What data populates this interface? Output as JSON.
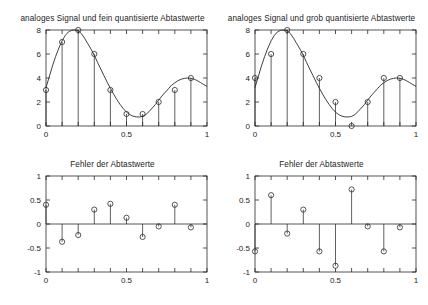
{
  "figure": {
    "background": "#ffffff",
    "line_color": "#2b2b2b",
    "axis_color": "#2a2a2a"
  },
  "panels": {
    "top_left": {
      "title": "analoges Signal und fein quantisierte Abtastwerte",
      "x_ticks": [
        "0",
        "0.5",
        "1"
      ],
      "y_ticks": [
        "0",
        "2",
        "4",
        "6",
        "8"
      ]
    },
    "top_right": {
      "title": "analoges Signal und grob quantisierte Abtastwerte",
      "x_ticks": [
        "0",
        "0.5",
        "1"
      ],
      "y_ticks": [
        "0",
        "2",
        "4",
        "6",
        "8"
      ]
    },
    "bottom_left": {
      "title": "Fehler der Abtastwerte",
      "x_ticks": [
        "0",
        "0.5",
        "1"
      ],
      "y_ticks": [
        "-1",
        "-0.5",
        "0",
        "0.5",
        "1"
      ]
    },
    "bottom_right": {
      "title": "Fehler der Abtastwerte",
      "x_ticks": [
        "0",
        "0.5",
        "1"
      ],
      "y_ticks": [
        "-1",
        "-0.5",
        "0",
        "0.5",
        "1"
      ]
    }
  },
  "chart_data": [
    {
      "id": "top_left",
      "type": "line",
      "title": "analoges Signal und fein quantisierte Abtastwerte",
      "xlabel": "",
      "ylabel": "",
      "xlim": [
        0,
        1
      ],
      "ylim": [
        0,
        8
      ],
      "xticks": [
        0,
        0.5,
        1
      ],
      "yticks": [
        0,
        2,
        4,
        6,
        8
      ],
      "minor_xticks": [
        0.1,
        0.2,
        0.3,
        0.4,
        0.6,
        0.7,
        0.8,
        0.9
      ],
      "grid": false,
      "legend": null,
      "series": [
        {
          "name": "analoges Signal",
          "type": "line",
          "x": [
            0.0,
            0.02,
            0.04,
            0.06,
            0.08,
            0.1,
            0.12,
            0.14,
            0.16,
            0.18,
            0.2,
            0.22,
            0.24,
            0.26,
            0.28,
            0.3,
            0.32,
            0.34,
            0.36,
            0.38,
            0.4,
            0.42,
            0.44,
            0.46,
            0.48,
            0.5,
            0.52,
            0.54,
            0.56,
            0.58,
            0.6,
            0.62,
            0.64,
            0.66,
            0.68,
            0.7,
            0.72,
            0.74,
            0.76,
            0.78,
            0.8,
            0.82,
            0.84,
            0.86,
            0.88,
            0.9,
            0.92,
            0.94,
            0.96,
            0.98,
            1.0
          ],
          "y": [
            3.2,
            4.1,
            5.0,
            5.8,
            6.5,
            7.1,
            7.55,
            7.85,
            7.98,
            8.0,
            7.95,
            7.7,
            7.3,
            6.85,
            6.4,
            5.9,
            5.3,
            4.75,
            4.2,
            3.65,
            3.15,
            2.65,
            2.2,
            1.8,
            1.45,
            1.15,
            0.95,
            0.82,
            0.76,
            0.75,
            0.8,
            0.95,
            1.2,
            1.5,
            1.8,
            2.15,
            2.5,
            2.8,
            3.1,
            3.4,
            3.6,
            3.78,
            3.9,
            3.97,
            4.0,
            3.98,
            3.9,
            3.78,
            3.62,
            3.45,
            3.3
          ]
        },
        {
          "name": "fein quantisierte Abtastwerte",
          "type": "stem",
          "x": [
            0.0,
            0.1,
            0.2,
            0.3,
            0.4,
            0.5,
            0.6,
            0.7,
            0.8,
            0.9
          ],
          "y": [
            3,
            7,
            8,
            6,
            3,
            1,
            1,
            2,
            3,
            4
          ]
        }
      ]
    },
    {
      "id": "top_right",
      "type": "line",
      "title": "analoges Signal und grob quantisierte Abtastwerte",
      "xlabel": "",
      "ylabel": "",
      "xlim": [
        0,
        1
      ],
      "ylim": [
        0,
        8
      ],
      "xticks": [
        0,
        0.5,
        1
      ],
      "yticks": [
        0,
        2,
        4,
        6,
        8
      ],
      "minor_xticks": [
        0.1,
        0.2,
        0.3,
        0.4,
        0.6,
        0.7,
        0.8,
        0.9
      ],
      "grid": false,
      "legend": null,
      "series": [
        {
          "name": "analoges Signal",
          "type": "line",
          "x": [
            0.0,
            0.02,
            0.04,
            0.06,
            0.08,
            0.1,
            0.12,
            0.14,
            0.16,
            0.18,
            0.2,
            0.22,
            0.24,
            0.26,
            0.28,
            0.3,
            0.32,
            0.34,
            0.36,
            0.38,
            0.4,
            0.42,
            0.44,
            0.46,
            0.48,
            0.5,
            0.52,
            0.54,
            0.56,
            0.58,
            0.6,
            0.62,
            0.64,
            0.66,
            0.68,
            0.7,
            0.72,
            0.74,
            0.76,
            0.78,
            0.8,
            0.82,
            0.84,
            0.86,
            0.88,
            0.9,
            0.92,
            0.94,
            0.96,
            0.98,
            1.0
          ],
          "y": [
            3.2,
            4.1,
            5.0,
            5.8,
            6.5,
            7.1,
            7.55,
            7.85,
            7.98,
            8.0,
            7.95,
            7.7,
            7.3,
            6.85,
            6.4,
            5.9,
            5.3,
            4.75,
            4.2,
            3.65,
            3.15,
            2.65,
            2.2,
            1.8,
            1.45,
            1.15,
            0.95,
            0.82,
            0.76,
            0.75,
            0.8,
            0.95,
            1.2,
            1.5,
            1.8,
            2.15,
            2.5,
            2.8,
            3.1,
            3.4,
            3.6,
            3.78,
            3.9,
            3.97,
            4.0,
            3.98,
            3.9,
            3.78,
            3.62,
            3.45,
            3.3
          ]
        },
        {
          "name": "grob quantisierte Abtastwerte",
          "type": "stem",
          "x": [
            0.0,
            0.1,
            0.2,
            0.3,
            0.4,
            0.5,
            0.6,
            0.7,
            0.8,
            0.9
          ],
          "y": [
            4,
            6,
            8,
            6,
            4,
            2,
            0,
            2,
            4,
            4
          ]
        }
      ]
    },
    {
      "id": "bottom_left",
      "type": "scatter",
      "title": "Fehler der Abtastwerte",
      "xlabel": "",
      "ylabel": "",
      "xlim": [
        0,
        1
      ],
      "ylim": [
        -1,
        1
      ],
      "xticks": [
        0,
        0.5,
        1
      ],
      "yticks": [
        -1,
        -0.5,
        0,
        0.5,
        1
      ],
      "minor_xticks": [
        0.1,
        0.2,
        0.3,
        0.4,
        0.6,
        0.7,
        0.8,
        0.9
      ],
      "grid": false,
      "legend": null,
      "series": [
        {
          "name": "Fehler (fein)",
          "type": "stem",
          "x": [
            0.0,
            0.1,
            0.2,
            0.3,
            0.4,
            0.5,
            0.6,
            0.7,
            0.8,
            0.9
          ],
          "y": [
            0.4,
            -0.37,
            -0.23,
            0.3,
            0.42,
            0.13,
            -0.27,
            -0.05,
            0.4,
            -0.07
          ]
        }
      ]
    },
    {
      "id": "bottom_right",
      "type": "scatter",
      "title": "Fehler der Abtastwerte",
      "xlabel": "",
      "ylabel": "",
      "xlim": [
        0,
        1
      ],
      "ylim": [
        -1,
        1
      ],
      "xticks": [
        0,
        0.5,
        1
      ],
      "yticks": [
        -1,
        -0.5,
        0,
        0.5,
        1
      ],
      "minor_xticks": [
        0.1,
        0.2,
        0.3,
        0.4,
        0.6,
        0.7,
        0.8,
        0.9
      ],
      "grid": false,
      "legend": null,
      "series": [
        {
          "name": "Fehler (grob)",
          "type": "stem",
          "x": [
            0.0,
            0.1,
            0.2,
            0.3,
            0.4,
            0.5,
            0.6,
            0.7,
            0.8,
            0.9
          ],
          "y": [
            -0.57,
            0.6,
            -0.2,
            0.3,
            -0.57,
            -0.87,
            0.72,
            -0.05,
            -0.57,
            -0.07
          ]
        }
      ]
    }
  ]
}
